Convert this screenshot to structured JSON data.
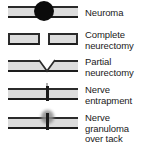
{
  "figure": {
    "kind": "nerve-condition-legend",
    "background_color": "#ffffff",
    "nerve_fill_color": "#dcdcdc",
    "nerve_outline_color": "#2b2b2b",
    "marker_color": "#0b0b0b",
    "text_color": "#1a1a1a"
  },
  "rows": [
    {
      "id": "neuroma",
      "label": "Neuroma",
      "glyph": "nerve-with-bulb",
      "top": 6,
      "label_top": 8
    },
    {
      "id": "complete-neurectomy",
      "label": "Complete\nneurectomy",
      "glyph": "nerve-severed-two-segments",
      "top": 33,
      "label_top": 30
    },
    {
      "id": "partial-neurectomy",
      "label": "Partial\nneurectomy",
      "glyph": "nerve-with-v-wedge",
      "top": 60,
      "label_top": 57
    },
    {
      "id": "nerve-entrapment",
      "label": "Nerve\nentrapment",
      "glyph": "nerve-with-tack",
      "top": 88,
      "label_top": 85
    },
    {
      "id": "nerve-granuloma-over-tack",
      "label": "Nerve\ngranuloma\nover tack",
      "glyph": "nerve-with-granuloma-over-tack",
      "top": 117,
      "label_top": 113
    }
  ]
}
